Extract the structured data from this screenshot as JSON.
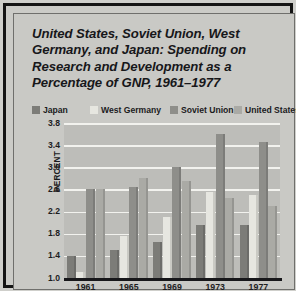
{
  "figure": {
    "title": "United States, Soviet Union, West Germany, and Japan: Spending on Research and Development as a Percentage of GNP, 1961–1977",
    "source": "SOURCE: Data Resources"
  },
  "colors": {
    "japan": "#7c7c78",
    "west_germany": "#e6e6e0",
    "soviet_union": "#8e8e8a",
    "united_states": "#aaaaa5",
    "plot_background": "#bdbdb9",
    "panel_background": "#c9c9c5",
    "gridline": "#f2f2ee",
    "axis": "#17171a",
    "text": "#1b1b1d"
  },
  "chart_data": {
    "type": "bar",
    "title": "United States, Soviet Union, West Germany, and Japan: Spending on Research and Development as a Percentage of GNP, 1961–1977",
    "xlabel": "",
    "ylabel": "PERCENT",
    "ylim": [
      1.0,
      3.8
    ],
    "yticks": [
      "1.0",
      "1.4",
      "1.8",
      "2.2",
      "2.6",
      "3.0",
      "3.4",
      "3.8"
    ],
    "ytick_values": [
      1.0,
      1.4,
      1.8,
      2.2,
      2.6,
      3.0,
      3.4,
      3.8
    ],
    "grid": true,
    "legend_position": "above-plot",
    "baseline": 1.0,
    "categories": [
      "1961",
      "1965",
      "1969",
      "1973",
      "1977"
    ],
    "series": [
      {
        "name": "Japan",
        "color_key": "japan",
        "values": [
          1.4,
          1.5,
          1.65,
          1.95,
          1.95
        ]
      },
      {
        "name": "West Germany",
        "color_key": "west_germany",
        "values": [
          1.1,
          1.75,
          2.1,
          2.55,
          2.5
        ]
      },
      {
        "name": "Soviet Union",
        "color_key": "soviet_union",
        "values": [
          2.6,
          2.65,
          3.0,
          3.6,
          3.45
        ]
      },
      {
        "name": "United States",
        "color_key": "united_states",
        "values": [
          2.6,
          2.8,
          2.75,
          2.45,
          2.3
        ]
      }
    ]
  },
  "legend": {
    "items": [
      {
        "label": "Japan",
        "color_key": "japan",
        "left": 0
      },
      {
        "label": "West Germany",
        "color_key": "west_germany",
        "left": 58
      },
      {
        "label": "Soviet Union",
        "color_key": "soviet_union",
        "left": 138
      },
      {
        "label": "United States",
        "color_key": "united_states",
        "left": 202
      }
    ]
  }
}
